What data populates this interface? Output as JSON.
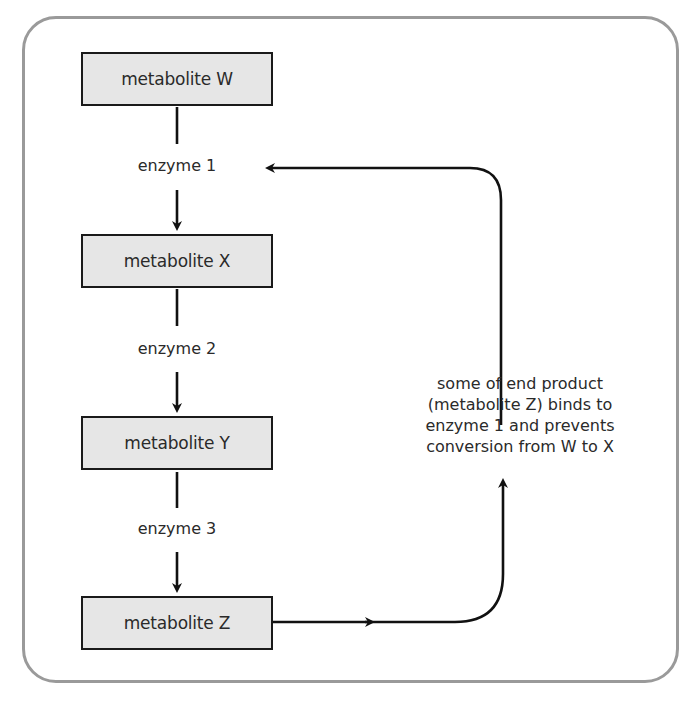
{
  "diagram": {
    "type": "metabolic pathway with end-product (feedback) inhibition",
    "metabolites": [
      {
        "id": "W",
        "label": "metabolite W"
      },
      {
        "id": "X",
        "label": "metabolite X"
      },
      {
        "id": "Y",
        "label": "metabolite Y"
      },
      {
        "id": "Z",
        "label": "metabolite Z"
      }
    ],
    "enzymes": [
      {
        "label": "enzyme 1",
        "from": "W",
        "to": "X"
      },
      {
        "label": "enzyme 2",
        "from": "X",
        "to": "Y"
      },
      {
        "label": "enzyme 3",
        "from": "Y",
        "to": "Z"
      }
    ],
    "feedback": {
      "from": "metabolite Z",
      "to": "enzyme 1",
      "note_lines": [
        "some of end product",
        "(metabolite Z) binds to",
        "enzyme 1 and prevents",
        "conversion from W to X"
      ]
    }
  },
  "colors": {
    "frame_border": "#9a9a9a",
    "box_fill": "#e6e6e6",
    "box_border": "#1a1a1a",
    "arrow": "#111111",
    "text": "#2a2a2a"
  }
}
